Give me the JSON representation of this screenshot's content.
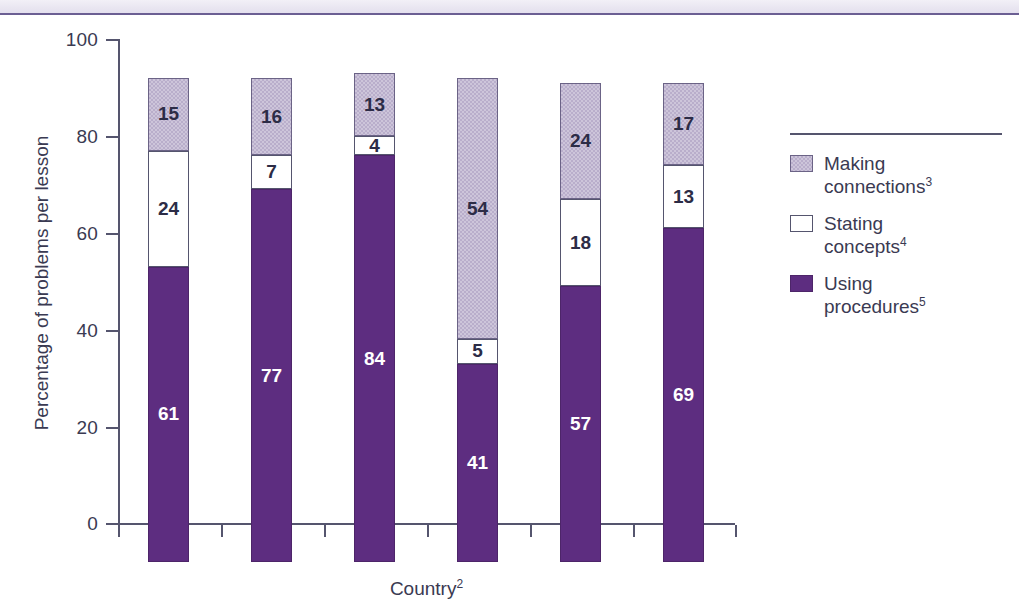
{
  "chart_data": {
    "type": "bar",
    "subtype": "stacked-column-100",
    "title": "",
    "xlabel": "Country2",
    "xlabel_text": "Country",
    "xlabel_sup": "2",
    "ylabel": "Percentage of problems per lesson",
    "ylim": [
      0,
      100
    ],
    "yticks": [
      0,
      20,
      40,
      60,
      80,
      100
    ],
    "ytick_labels": [
      "0",
      "20",
      "40",
      "60",
      "80",
      "100"
    ],
    "grid": false,
    "legend_position": "right",
    "categories": [
      "AU",
      "CZ",
      "HK",
      "JP1",
      "NL",
      "US"
    ],
    "category_labels": [
      {
        "text": "AU",
        "sup": ""
      },
      {
        "text": "CZ",
        "sup": ""
      },
      {
        "text": "HK",
        "sup": ""
      },
      {
        "text": "JP",
        "sup": "1"
      },
      {
        "text": "NL",
        "sup": ""
      },
      {
        "text": "US",
        "sup": ""
      }
    ],
    "series": [
      {
        "name": "Using procedures5",
        "name_text": "Using\nprocedures",
        "sup": "5",
        "key": "using",
        "color": "#5d2d80",
        "values": [
          61,
          77,
          84,
          41,
          57,
          69
        ]
      },
      {
        "name": "Stating concepts4",
        "name_text": "Stating\nconcepts",
        "sup": "4",
        "key": "stating",
        "color": "#ffffff",
        "values": [
          24,
          7,
          4,
          5,
          18,
          13
        ]
      },
      {
        "name": "Making connections3",
        "name_text": "Making\nconnections",
        "sup": "3",
        "key": "making",
        "color": "#c3bad3",
        "values": [
          15,
          16,
          13,
          54,
          24,
          17
        ]
      }
    ],
    "bar_totals": [
      100,
      100,
      101,
      100,
      99,
      99
    ],
    "data_labels": {
      "AU": {
        "using": "61",
        "stating": "24",
        "making": "15"
      },
      "CZ": {
        "using": "77",
        "stating": "7",
        "making": "16"
      },
      "HK": {
        "using": "84",
        "stating": "4",
        "making": "13"
      },
      "JP": {
        "using": "41",
        "stating": "5",
        "making": "54"
      },
      "NL": {
        "using": "57",
        "stating": "18",
        "making": "24"
      },
      "US": {
        "using": "69",
        "stating": "13",
        "making": "17"
      }
    }
  },
  "legend": {
    "items": [
      {
        "label_line1": "Making",
        "label_line2": "connections",
        "sup": "3",
        "swatch": "making-swatch"
      },
      {
        "label_line1": "Stating",
        "label_line2": "concepts",
        "sup": "4",
        "swatch": "stating-swatch"
      },
      {
        "label_line1": "Using",
        "label_line2": "procedures",
        "sup": "5",
        "swatch": "using-swatch"
      }
    ]
  },
  "colors": {
    "using_procedures": "#5d2d80",
    "stating_concepts": "#ffffff",
    "making_connections": "#c3bad3",
    "axis": "#55556e",
    "text": "#3a3a52",
    "top_band": "#e9e6f1",
    "top_rule": "#6b5f93"
  }
}
